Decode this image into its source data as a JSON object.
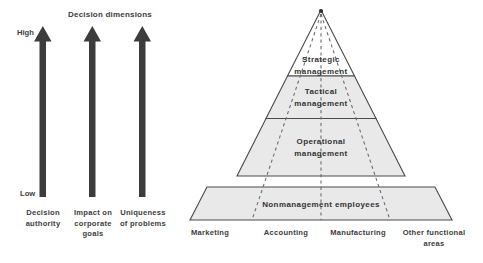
{
  "figure": {
    "title": "Decision dimensions",
    "axis_high_label": "High",
    "axis_low_label": "Low",
    "colors": {
      "band_fill": "#e9e9e9",
      "top_band_fill": "#ffffff",
      "outline": "#4a4a4a",
      "arrow": "#3c3c3c",
      "dashed_divider": "#6e6e6e",
      "text": "#3d3d3d"
    },
    "dimensions": [
      {
        "label": "Decision\nauthority"
      },
      {
        "label": "Impact on\ncorporate\ngoals"
      },
      {
        "label": "Uniqueness\nof problems"
      }
    ],
    "pyramid": {
      "levels": [
        {
          "label": "Strategic\nmanagement"
        },
        {
          "label": "Tactical\nmanagement"
        },
        {
          "label": "Operational\nmanagement"
        },
        {
          "label": "Nonmanagement employees"
        }
      ],
      "functional_areas": [
        {
          "label": "Marketing"
        },
        {
          "label": "Accounting"
        },
        {
          "label": "Manufacturing"
        },
        {
          "label": "Other functional\nareas"
        }
      ]
    }
  }
}
